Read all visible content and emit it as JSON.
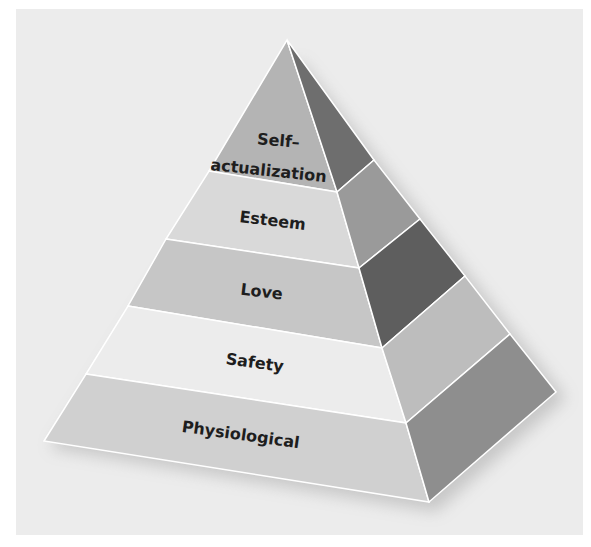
{
  "diagram": {
    "type": "pyramid",
    "title_fragment": "",
    "levels_top_to_bottom": [
      {
        "label_line1": "Self–",
        "label_line2": "actualization",
        "front_color": "#b4b4b4",
        "side_color": "#6e6e6e"
      },
      {
        "label": "Esteem",
        "front_color": "#d9d9d9",
        "side_color": "#9a9a9a"
      },
      {
        "label": "Love",
        "front_color": "#c6c6c6",
        "side_color": "#5e5e5e"
      },
      {
        "label": "Safety",
        "front_color": "#ececec",
        "side_color": "#bdbdbd"
      },
      {
        "label": "Physiological",
        "front_color": "#d0d0d0",
        "side_color": "#8e8e8e"
      }
    ],
    "background_color": "#ececec",
    "edge_color": "#ffffff"
  }
}
